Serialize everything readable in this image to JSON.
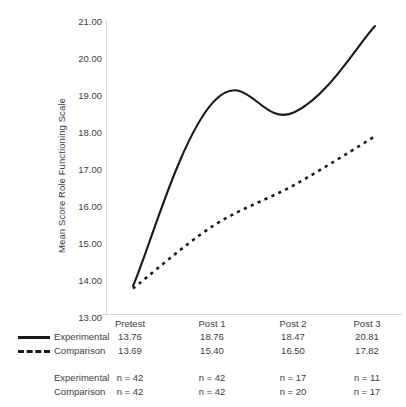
{
  "chart_data": {
    "type": "line",
    "title": "",
    "xlabel": "",
    "ylabel": "Mean Score Role Functioning Scale",
    "categories": [
      "Pretest",
      "Post 1",
      "Post 2",
      "Post 3"
    ],
    "ylim": [
      13.0,
      21.0
    ],
    "yticks": [
      "13.00",
      "14.00",
      "15.00",
      "16.00",
      "17.00",
      "18.00",
      "19.00",
      "20.00",
      "21.00"
    ],
    "grid": false,
    "legend_position": "bottom-left",
    "series": [
      {
        "name": "Experimental",
        "style": "solid",
        "color": "#1a1a1a",
        "values": [
          13.76,
          18.76,
          18.47,
          20.81
        ],
        "value_labels": [
          "13.76",
          "18.76",
          "18.47",
          "20.81"
        ],
        "n_labels": [
          "n = 42",
          "n = 42",
          "n = 17",
          "n = 11"
        ]
      },
      {
        "name": "Comparison",
        "style": "dashed",
        "color": "#1a1a1a",
        "values": [
          13.69,
          15.4,
          16.5,
          17.82
        ],
        "value_labels": [
          "13.69",
          "15.40",
          "16.50",
          "17.82"
        ],
        "n_labels": [
          "n = 42",
          "n = 42",
          "n = 20",
          "n = 17"
        ]
      }
    ]
  },
  "axis": {
    "y_title": "Mean Score Role Functioning Scale",
    "y_ticks": [
      "21.00",
      "20.00",
      "19.00",
      "18.00",
      "17.00",
      "16.00",
      "15.00",
      "14.00",
      "13.00"
    ]
  },
  "table": {
    "header": [
      "Pretest",
      "Post 1",
      "Post 2",
      "Post 3"
    ],
    "rows": [
      {
        "label": "Experimental",
        "style": "solid",
        "cells": [
          "13.76",
          "18.76",
          "18.47",
          "20.81"
        ]
      },
      {
        "label": "Comparison",
        "style": "dashed",
        "cells": [
          "13.69",
          "15.40",
          "16.50",
          "17.82"
        ]
      }
    ],
    "n_rows": [
      {
        "label": "Experimental",
        "cells": [
          "n = 42",
          "n = 42",
          "n = 17",
          "n = 11"
        ]
      },
      {
        "label": "Comparison",
        "cells": [
          "n = 42",
          "n = 42",
          "n = 20",
          "n = 17"
        ]
      }
    ]
  }
}
